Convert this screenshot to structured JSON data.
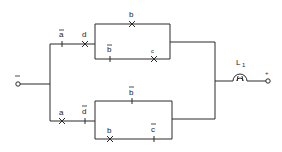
{
  "diagram": {
    "type": "relay contact circuit",
    "terminals": {
      "negative": "−",
      "positive": "+"
    },
    "lamp": {
      "label": "L",
      "subscript": "1"
    },
    "upper_branch": {
      "series": [
        {
          "label": "a",
          "negated": true,
          "type": "NC"
        },
        {
          "label": "d",
          "negated": false,
          "type": "NO"
        }
      ],
      "parallel_paths": [
        [
          {
            "label": "b",
            "negated": false,
            "type": "NO"
          }
        ],
        [
          {
            "label": "b",
            "negated": true,
            "type": "NC"
          },
          {
            "label": "c",
            "negated": false,
            "type": "NO"
          }
        ]
      ]
    },
    "lower_branch": {
      "series": [
        {
          "label": "a",
          "negated": false,
          "type": "NO"
        },
        {
          "label": "d",
          "negated": true,
          "type": "NC"
        }
      ],
      "parallel_paths": [
        [
          {
            "label": "b",
            "negated": true,
            "type": "NC"
          }
        ],
        [
          {
            "label": "b",
            "negated": false,
            "type": "NO"
          },
          {
            "label": "c",
            "negated": true,
            "type": "NC"
          }
        ]
      ]
    },
    "labels": {
      "a": "a",
      "b": "b",
      "c": "c",
      "d": "d",
      "minus": "−",
      "plus": "+",
      "L": "L",
      "one": "1"
    }
  }
}
